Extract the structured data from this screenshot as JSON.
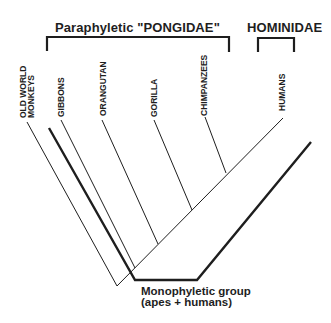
{
  "diagram": {
    "type": "cladogram",
    "groups": [
      {
        "id": "pongidae",
        "label": "Paraphyletic  \"PONGIDAE\""
      },
      {
        "id": "hominidae",
        "label": "HOMINIDAE"
      }
    ],
    "taxa": [
      {
        "id": "owm",
        "line1": "OLD WORLD",
        "line2": "MONKEYS"
      },
      {
        "id": "gibbons",
        "label": "GIBBONS"
      },
      {
        "id": "orangutan",
        "label": "ORANGUTAN"
      },
      {
        "id": "gorilla",
        "label": "GORILLA"
      },
      {
        "id": "chimpanzees",
        "label": "CHIMPANZEES"
      },
      {
        "id": "humans",
        "label": "HUMANS"
      }
    ],
    "annotation": {
      "line1": "Monophyletic group",
      "line2": "(apes + humans)"
    },
    "colors": {
      "ink": "#1e1e1e",
      "background": "#ffffff"
    }
  }
}
